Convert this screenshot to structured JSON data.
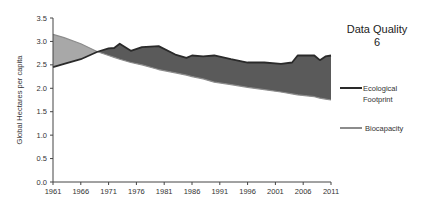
{
  "chart_data": {
    "type": "area",
    "title": "Data Quality",
    "subtitle": "6",
    "xlabel": "",
    "ylabel": "Global Hectares per capita",
    "xlim": [
      1961,
      2011
    ],
    "ylim": [
      0.0,
      3.5
    ],
    "x_ticks": [
      "1961",
      "1966",
      "1971",
      "1976",
      "1981",
      "1986",
      "1991",
      "1996",
      "2001",
      "2006",
      "2011"
    ],
    "y_ticks": [
      "0.0",
      "0.5",
      "1.0",
      "1.5",
      "2.0",
      "2.5",
      "3.0",
      "3.5"
    ],
    "grid": false,
    "legend_position": "right",
    "x": [
      1961,
      1963,
      1966,
      1969,
      1971,
      1972,
      1973,
      1975,
      1977,
      1980,
      1983,
      1985,
      1986,
      1988,
      1990,
      1993,
      1996,
      1999,
      2002,
      2004,
      2005,
      2008,
      2009,
      2010,
      2011
    ],
    "series": [
      {
        "name": "Ecological Footprint",
        "color": "#2a2a2a",
        "values": [
          2.45,
          2.52,
          2.62,
          2.78,
          2.85,
          2.86,
          2.95,
          2.8,
          2.88,
          2.9,
          2.72,
          2.65,
          2.7,
          2.68,
          2.7,
          2.62,
          2.55,
          2.55,
          2.52,
          2.55,
          2.7,
          2.7,
          2.6,
          2.68,
          2.7
        ]
      },
      {
        "name": "Biocapacity",
        "color": "#8c8c8c",
        "values": [
          3.15,
          3.08,
          2.95,
          2.78,
          2.7,
          2.66,
          2.62,
          2.55,
          2.5,
          2.4,
          2.33,
          2.28,
          2.25,
          2.2,
          2.13,
          2.08,
          2.02,
          1.97,
          1.92,
          1.88,
          1.86,
          1.82,
          1.79,
          1.77,
          1.75
        ]
      }
    ],
    "fill": {
      "deficit_color": "#5a5a5a",
      "reserve_color": "#a8a8a8"
    }
  },
  "legend": {
    "items": [
      {
        "label_line1": "Ecological",
        "label_line2": "Footprint",
        "color": "#2a2a2a"
      },
      {
        "label_line1": "Biocapacity",
        "label_line2": "",
        "color": "#8c8c8c"
      }
    ]
  }
}
